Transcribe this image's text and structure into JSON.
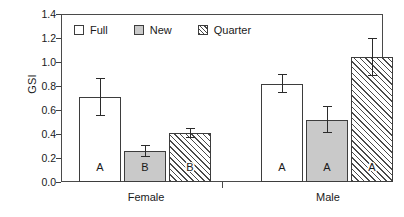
{
  "chart_data": {
    "type": "bar",
    "title": "",
    "xlabel": "",
    "ylabel": "GSI",
    "ylim": [
      0.0,
      1.4
    ],
    "ytick_values": [
      1.4,
      1.2,
      1.0,
      0.8,
      0.6,
      0.4,
      0.2,
      0.0
    ],
    "ytick_labels": [
      "1.4",
      "1.2",
      "1.0",
      "0.8",
      "0.6",
      "0.4",
      "0.2",
      "0.0"
    ],
    "grid": false,
    "legend_position": "upper-left-inside",
    "categories": [
      "Female",
      "Male"
    ],
    "series": [
      {
        "name": "Full",
        "fill": "white",
        "values": [
          0.71,
          0.82
        ],
        "errors": [
          0.16,
          0.08
        ],
        "letters": [
          "A",
          "A"
        ]
      },
      {
        "name": "New",
        "fill": "gray",
        "values": [
          0.26,
          0.52
        ],
        "errors": [
          0.05,
          0.11
        ],
        "letters": [
          "B",
          "A"
        ]
      },
      {
        "name": "Quarter",
        "fill": "hatched",
        "values": [
          0.41,
          1.04
        ],
        "errors": [
          0.04,
          0.16
        ],
        "letters": [
          "B",
          "A"
        ]
      }
    ],
    "annotations": {
      "female_letters": [
        "A",
        "B",
        "B"
      ],
      "male_letters": [
        "A",
        "A",
        "A"
      ]
    }
  },
  "legend": {
    "entries": [
      {
        "label": "Full",
        "swatch": "legend-swatch-full-icon"
      },
      {
        "label": "New",
        "swatch": "legend-swatch-new-icon"
      },
      {
        "label": "Quarter",
        "swatch": "legend-swatch-quarter-icon"
      }
    ]
  }
}
